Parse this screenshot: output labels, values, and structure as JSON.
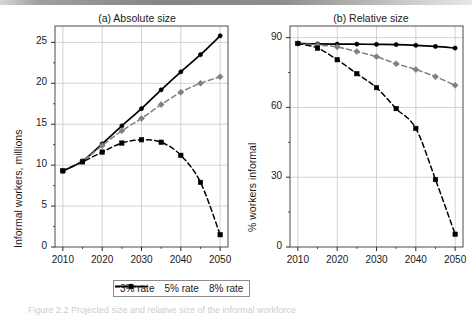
{
  "figure": {
    "background": "#ffffff",
    "caption": "Figure 2.2  Projected size and relative size of the informal workforce"
  },
  "legend": {
    "position": "bottom-center",
    "entries": [
      {
        "label": "3% rate",
        "color": "#000000",
        "style": "solid",
        "marker": "circle"
      },
      {
        "label": "5% rate",
        "color": "#808080",
        "style": "dashed",
        "marker": "diamond"
      },
      {
        "label": "8% rate",
        "color": "#000000",
        "style": "dashed",
        "marker": "square"
      }
    ]
  },
  "chart_data": [
    {
      "type": "line",
      "panel": "a",
      "title": "(a) Absolute size",
      "xlabel": "",
      "ylabel": "Informal workers, millions",
      "x": [
        2010,
        2015,
        2020,
        2025,
        2030,
        2035,
        2040,
        2045,
        2050
      ],
      "xticks": [
        2010,
        2020,
        2030,
        2040,
        2050
      ],
      "yticks": [
        0,
        5,
        10,
        15,
        20,
        25
      ],
      "xlim": [
        2008,
        2052
      ],
      "ylim": [
        0,
        27
      ],
      "grid": true,
      "legend": "bottom",
      "series": [
        {
          "name": "3% rate",
          "color": "#000000",
          "style": "solid",
          "marker": "circle",
          "values": [
            9.3,
            10.5,
            12.6,
            14.8,
            16.9,
            19.2,
            21.4,
            23.5,
            25.8
          ]
        },
        {
          "name": "5% rate",
          "color": "#808080",
          "style": "dashed",
          "marker": "diamond",
          "values": [
            9.3,
            10.5,
            12.4,
            14.2,
            15.7,
            17.4,
            18.9,
            20.0,
            20.8
          ]
        },
        {
          "name": "8% rate",
          "color": "#000000",
          "style": "dashed",
          "marker": "square",
          "values": [
            9.3,
            10.4,
            11.6,
            12.7,
            13.1,
            12.8,
            11.2,
            7.9,
            1.5
          ]
        }
      ]
    },
    {
      "type": "line",
      "panel": "b",
      "title": "(b) Relative size",
      "xlabel": "",
      "ylabel": "% workers informal",
      "x": [
        2010,
        2015,
        2020,
        2025,
        2030,
        2035,
        2040,
        2045,
        2050
      ],
      "xticks": [
        2010,
        2020,
        2030,
        2040,
        2050
      ],
      "yticks": [
        0,
        30,
        60,
        90
      ],
      "xlim": [
        2008,
        2052
      ],
      "ylim": [
        0,
        95
      ],
      "grid": true,
      "legend": "bottom",
      "series": [
        {
          "name": "3% rate",
          "color": "#000000",
          "style": "solid",
          "marker": "circle",
          "values": [
            87.5,
            87.3,
            87.2,
            87.2,
            87.1,
            87.0,
            86.7,
            86.2,
            85.5
          ]
        },
        {
          "name": "5% rate",
          "color": "#808080",
          "style": "dashed",
          "marker": "diamond",
          "values": [
            87.5,
            86.8,
            86.0,
            84.0,
            81.8,
            78.8,
            76.3,
            73.2,
            69.5
          ]
        },
        {
          "name": "8% rate",
          "color": "#000000",
          "style": "dashed",
          "marker": "square",
          "values": [
            87.5,
            85.5,
            80.5,
            74.5,
            68.5,
            59.5,
            51.0,
            29.0,
            5.5
          ]
        }
      ]
    }
  ]
}
